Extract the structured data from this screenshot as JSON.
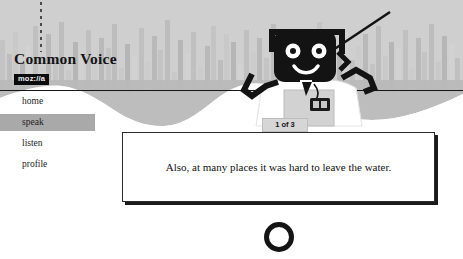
{
  "brand": {
    "title": "Common Voice",
    "badge": "moz://a"
  },
  "nav": {
    "items": [
      {
        "label": "home",
        "active": false
      },
      {
        "label": "speak",
        "active": true
      },
      {
        "label": "listen",
        "active": false
      },
      {
        "label": "profile",
        "active": false
      }
    ]
  },
  "header": {
    "waveform_icon": "audio-waveform",
    "playhead_icon": "playhead-marker"
  },
  "mascot": {
    "name": "common-voice-robot",
    "antenna_icon": "antenna",
    "face_icon": "smiling-robot-face"
  },
  "progress": {
    "label": "1 of 3",
    "current": 1,
    "total": 3
  },
  "sentence": {
    "text": "Also, at many places it was hard to leave the water."
  },
  "record": {
    "icon": "record-circle-icon",
    "label": ""
  },
  "colors": {
    "band": "#cfcfcf",
    "active_nav": "#a9a9a9",
    "ink": "#141414",
    "card_bg": "#ffffff"
  }
}
